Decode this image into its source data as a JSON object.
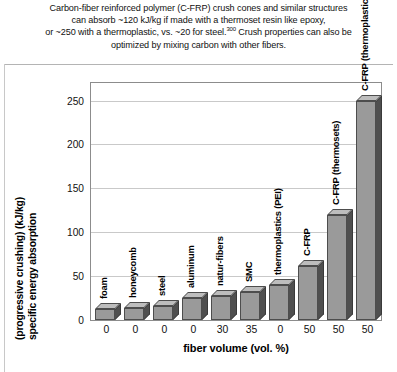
{
  "caption": {
    "lines": [
      "Carbon-fiber reinforced polymer (C-FRP) crush cones and similar structures",
      "can absorb ~120 kJ/kg if made with a thermoset resin like epoxy,",
      "or ~250 with a thermoplastic, vs. ~20 for steel.",
      "optimized by mixing carbon with other fibers."
    ],
    "line3_tail": " Crush properties can also be",
    "reference_superscript": "300"
  },
  "chart_data": {
    "type": "bar",
    "title": "",
    "xlabel": "fiber volume (vol. %)",
    "ylabel": "specific energy absorption (progressive crushing) (kJ/kg)",
    "ylabel_line1": "specific energy absorption",
    "ylabel_line2": "(progressive crushing) (kJ/kg)",
    "categories": [
      "foam",
      "honeycomb",
      "steel",
      "aluminum",
      "natur-fibers",
      "SMC",
      "thermoplastics (PEI)",
      "C-FRP",
      "C-FRP (thermosets)",
      "C-FRP (thermoplastics)"
    ],
    "values": [
      12,
      14,
      16,
      25,
      27,
      32,
      40,
      62,
      120,
      250
    ],
    "x_tick_labels": [
      "0",
      "0",
      "0",
      "0",
      "30",
      "35",
      "0",
      "50",
      "50",
      "50"
    ],
    "ylim": [
      0,
      270
    ],
    "yticks": [
      0,
      50,
      100,
      150,
      200,
      250
    ],
    "ytick_labels": [
      "0",
      "50",
      "100",
      "150",
      "200",
      "250"
    ],
    "grid": true,
    "legend": false,
    "bar_color": "#9a9a9a",
    "bar_side_color": "#4f4f4f",
    "bar_top_color": "#bdbdbd",
    "bar_edge_color": "#4d4d4d",
    "gridline_color": "#c9c9c9",
    "plot_border_color": "#8c8c8c",
    "background_color": "#ffffff"
  }
}
